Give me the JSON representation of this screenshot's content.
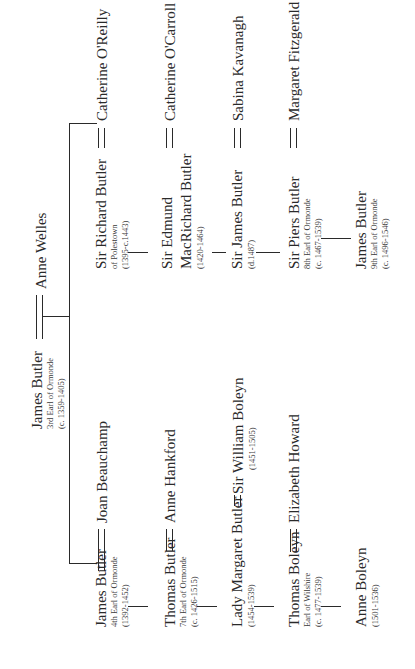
{
  "root": {
    "name": "James Butler",
    "title": "3rd Earl of Ormonde",
    "dates": "(c. 1359-1405)",
    "spouse": "Anne Welles"
  },
  "left_line": [
    {
      "name": "James Butler",
      "title": "4th Earl of Ormonde",
      "dates": "(1392-1452)",
      "spouse": "Joan Beauchamp"
    },
    {
      "name": "Thomas Butler",
      "title": "7th Earl of Ormonde",
      "dates": "(c. 1426-1515)",
      "spouse": "Anne Hankford"
    },
    {
      "name": "Lady Margaret Butler",
      "title": "",
      "dates": "(1454-1539)",
      "spouse": "Sir William Boleyn",
      "spouse_dates": "(1451-1505)"
    },
    {
      "name": "Thomas Boleyn",
      "title": "Earl of Wilshire",
      "dates": "(c. 1477-1539)",
      "spouse": "Elizabeth Howard"
    },
    {
      "name": "Anne Boleyn",
      "title": "",
      "dates": "(1501-1536)"
    }
  ],
  "right_line": [
    {
      "name": "Sir Richard Butler",
      "title": "of Polestown",
      "dates": "(1395-c.1443)",
      "spouse": "Catherine O'Reilly"
    },
    {
      "name": "Sir Edmund MacRichard Butler",
      "name_line1": "Sir Edmund",
      "name_line2": "MacRichard Butler",
      "title": "",
      "dates": "(1420-1464)",
      "spouse": "Catherine O'Carroll"
    },
    {
      "name": "Sir James Butler",
      "title": "",
      "dates": "(d.1487)",
      "spouse": "Sabina Kavanagh"
    },
    {
      "name": "Sir Piers Butler",
      "title": "8th Earl of Ormonde",
      "dates": "(c. 1467-1539)",
      "spouse": "Margaret Fitzgerald"
    },
    {
      "name": "James Butler",
      "title": "9th Earl of Ormonde",
      "dates": "(c. 1496-1546)"
    }
  ]
}
